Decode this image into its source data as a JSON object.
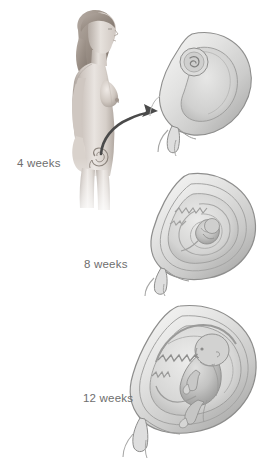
{
  "figure": {
    "background_color": "#ffffff",
    "label_color": "#6e6e6e",
    "palette": {
      "skin_light": "#e8e2dd",
      "skin_mid": "#c9c1bb",
      "skin_shadow": "#9b938d",
      "hair": "#a39890",
      "uterus_wall_light": "#ececeb",
      "uterus_wall_mid": "#d3d3d2",
      "uterus_wall_shadow": "#a9a9a8",
      "uterus_outline": "#8e8e8d",
      "cavity_fill": "#dededd",
      "fetus_fill": "#c4c4c3",
      "fetus_shadow": "#9a9a99",
      "arrow_color": "#4a4a4a"
    }
  },
  "stages": [
    {
      "id": "4-weeks",
      "label": "4 weeks",
      "icon_name": "uterus-4-weeks-cross-section",
      "description": "Pear-shaped uterus with a tiny round gestational sac and coiled embryo near the fundus"
    },
    {
      "id": "8-weeks",
      "label": "8 weeks",
      "icon_name": "uterus-8-weeks-cross-section",
      "description": "Enlarged uterus with curled embryo and spiral amniotic membranes filling the cavity"
    },
    {
      "id": "12-weeks",
      "label": "12 weeks",
      "icon_name": "uterus-12-weeks-cross-section",
      "description": "Large uterus containing a recognizable curled fetus, placenta along the upper wall and umbilical cord"
    }
  ],
  "body_figure": {
    "icon_name": "standing-female-body-profile",
    "description": "Side profile of a standing nude female figure, head to thighs, fading out at the legs",
    "uterus_marker_name": "pelvic-uterus-outline"
  },
  "callout_arrow": {
    "icon_name": "curved-callout-arrow",
    "description": "Curved arrow from the uterus on the pelvis pointing up-right to the 4 week uterus illustration"
  }
}
